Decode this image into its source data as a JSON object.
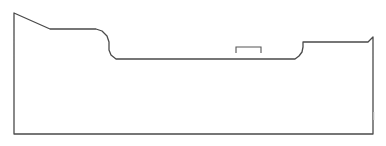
{
  "diagram": {
    "type": "profile-outline",
    "colors": {
      "stroke": "#4a4a4a",
      "bracket": "#555555",
      "background": "#ffffff"
    },
    "outline_points": [
      [
        14,
        134
      ],
      [
        14,
        13
      ],
      [
        50,
        29
      ],
      [
        96,
        29
      ],
      [
        102,
        31
      ],
      [
        107,
        36
      ],
      [
        109,
        42
      ],
      [
        109,
        50
      ],
      [
        111,
        55
      ],
      [
        116,
        59
      ],
      [
        295,
        59
      ],
      [
        299,
        56
      ],
      [
        302,
        52
      ],
      [
        303,
        47
      ],
      [
        303,
        42
      ],
      [
        368,
        42
      ],
      [
        373,
        37
      ],
      [
        373,
        134
      ],
      [
        14,
        134
      ]
    ],
    "bracket_points": [
      [
        236,
        53
      ],
      [
        236,
        47
      ],
      [
        261,
        47
      ],
      [
        261,
        53
      ]
    ],
    "labels": []
  }
}
